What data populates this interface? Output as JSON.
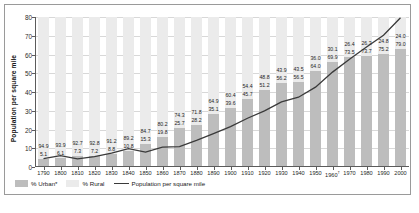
{
  "chart_data": {
    "type": "bar",
    "title": "",
    "xlabel": "",
    "ylabel": "Population per square mile",
    "ylim": [
      0,
      80
    ],
    "yticks": [
      0,
      10,
      20,
      30,
      40,
      50,
      60,
      70,
      80
    ],
    "grid": true,
    "legend_position": "bottom-left",
    "categories": [
      "1790",
      "1800",
      "1810",
      "1820",
      "1830",
      "1840",
      "1850",
      "1860",
      "1870",
      "1880",
      "1890",
      "1900",
      "1910",
      "1920",
      "1930",
      "1940",
      "1950",
      "1960",
      "1970",
      "1980",
      "1990",
      "2000"
    ],
    "category_notes": {
      "1960": "†"
    },
    "series": [
      {
        "name": "% Urban*",
        "type": "bar-stacked-bottom",
        "color": "#bdbdbd",
        "values": [
          5.1,
          6.1,
          7.3,
          7.2,
          8.8,
          10.8,
          15.3,
          19.8,
          25.7,
          28.2,
          35.1,
          39.6,
          45.6,
          51.2,
          56.1,
          56.5,
          64.0,
          69.9,
          73.6,
          73.7,
          75.2,
          79.0
        ]
      },
      {
        "name": "% Rural",
        "type": "bar-stacked-top",
        "color": "#ebebeb",
        "values": [
          94.9,
          93.9,
          92.7,
          92.8,
          91.2,
          89.2,
          84.7,
          80.2,
          74.3,
          71.8,
          64.9,
          60.4,
          54.4,
          48.8,
          43.9,
          43.5,
          36.0,
          30.1,
          26.4,
          26.3,
          24.8,
          21.0
        ]
      },
      {
        "name": "Population per square mile",
        "type": "line",
        "color": "#3a3a3a",
        "values": [
          4.5,
          6.1,
          4.3,
          5.5,
          7.4,
          9.8,
          7.9,
          10.6,
          10.9,
          14.2,
          17.8,
          21.5,
          26.0,
          29.9,
          34.7,
          37.2,
          42.6,
          50.6,
          57.5,
          64.0,
          70.3,
          79.6
        ]
      }
    ],
    "bar_labels_rural": [
      "94.9",
      "93.9",
      "92.7",
      "92.8",
      "91.2",
      "89.2",
      "84.7",
      "80.2",
      "74.3",
      "71.8",
      "64.9",
      "60.4",
      "54.4",
      "48.8",
      "43.9",
      "43.5",
      "36.0",
      "30.1",
      "26.4",
      "26.3",
      "24.8",
      "24.0"
    ],
    "bar_labels_urban": [
      "5.1",
      "6.1",
      "7.3",
      "7.2",
      "8.8",
      "10.8",
      "15.3",
      "19.8",
      "25.7",
      "28.2",
      "35.1",
      "39.6",
      "45.7",
      "51.2",
      "56.2",
      "56.5",
      "64.0",
      "69.9",
      "73.5",
      "73.7",
      "75.2",
      "79.0"
    ]
  },
  "axis": {
    "y_title": "Population per square mile"
  },
  "legend": {
    "urban_label": "% Urban*",
    "rural_label": "% Rural",
    "line_label": "Population per square mile"
  },
  "caption": {
    "text": ""
  }
}
